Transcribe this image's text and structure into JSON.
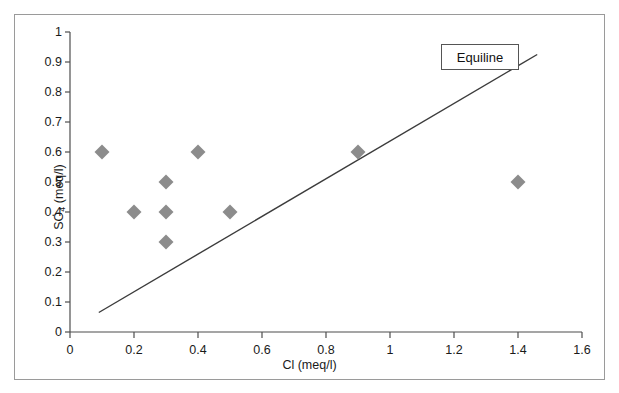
{
  "chart_data": {
    "type": "scatter",
    "title": "",
    "xlabel": "Cl (meq/l)",
    "ylabel": "SO4 (meq/l)",
    "ylabel_base": "SO",
    "ylabel_sub": "4",
    "ylabel_tail": " (meq/l)",
    "xlim": [
      0,
      1.6
    ],
    "ylim": [
      0,
      1
    ],
    "xticks": [
      "0",
      "0.2",
      "0.4",
      "0.6",
      "0.8",
      "1",
      "1.2",
      "1.4",
      "1.6"
    ],
    "xtick_values": [
      0,
      0.2,
      0.4,
      0.6,
      0.8,
      1,
      1.2,
      1.4,
      1.6
    ],
    "yticks": [
      "0",
      "0.1",
      "0.2",
      "0.3",
      "0.4",
      "0.5",
      "0.6",
      "0.7",
      "0.8",
      "0.9",
      "1"
    ],
    "ytick_values": [
      0,
      0.1,
      0.2,
      0.3,
      0.4,
      0.5,
      0.6,
      0.7,
      0.8,
      0.9,
      1
    ],
    "grid": false,
    "legend_position": "top-right",
    "series": [
      {
        "name": "samples",
        "marker": "diamond",
        "color": "#8c8c8c",
        "points": [
          {
            "x": 0.1,
            "y": 0.6
          },
          {
            "x": 0.2,
            "y": 0.4
          },
          {
            "x": 0.3,
            "y": 0.5
          },
          {
            "x": 0.3,
            "y": 0.4
          },
          {
            "x": 0.3,
            "y": 0.3
          },
          {
            "x": 0.4,
            "y": 0.6
          },
          {
            "x": 0.5,
            "y": 0.4
          },
          {
            "x": 0.9,
            "y": 0.6
          },
          {
            "x": 1.4,
            "y": 0.5
          }
        ]
      },
      {
        "name": "Equiline",
        "type": "line",
        "color": "#3c3c3c",
        "x": [
          0.09,
          1.46
        ],
        "y": [
          0.065,
          0.925
        ]
      }
    ],
    "annotations": [
      {
        "name": "equiline-callout",
        "text": "Equiline",
        "x": 1.16,
        "y": 0.91
      }
    ]
  },
  "legend": {
    "equiline_label": "Equiline"
  },
  "colors": {
    "marker": "#8c8c8c",
    "line": "#3c3c3c",
    "axis": "#4d4d4d",
    "frame": "#9a9a9a",
    "text": "#1a1a1a"
  }
}
